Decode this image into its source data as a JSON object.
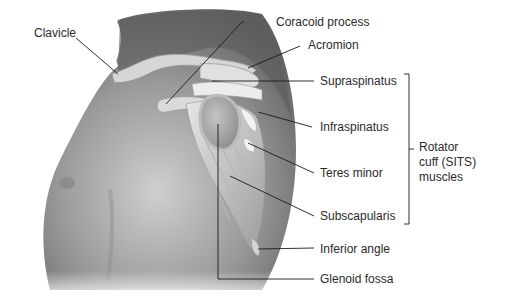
{
  "figure": {
    "labels": {
      "clavicle": "Clavicle",
      "coracoid": "Coracoid process",
      "acromion": "Acromion",
      "supraspinatus": "Supraspinatus",
      "infraspinatus": "Infraspinatus",
      "teres_minor": "Teres minor",
      "subscapularis": "Subscapularis",
      "inferior_angle": "Inferior angle",
      "glenoid_fossa": "Glenoid fossa"
    },
    "group": {
      "lines": [
        "Rotator",
        "cuff (SITS)",
        "muscles"
      ]
    },
    "colors": {
      "skin_dark": "#5a5a5a",
      "skin_mid": "#8e8e8e",
      "skin_light": "#c8c8c8",
      "bone": "#dcdcdc",
      "leader": "#1a1a1a",
      "text": "#2a2a2a"
    }
  }
}
